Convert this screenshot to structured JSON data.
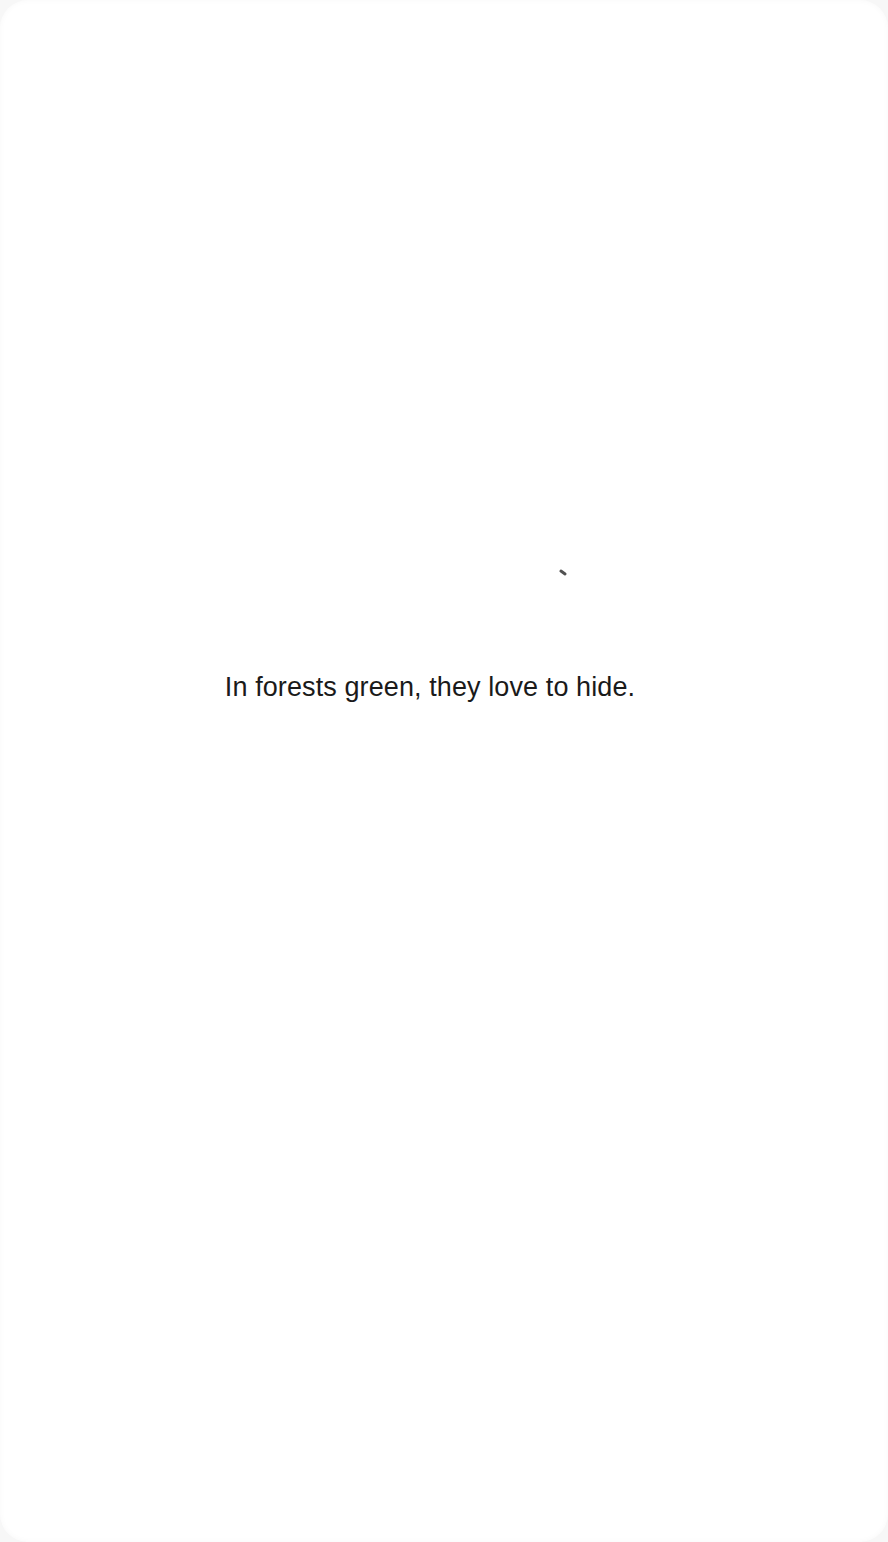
{
  "page": {
    "text_line": "In forests green, they love to hide."
  }
}
